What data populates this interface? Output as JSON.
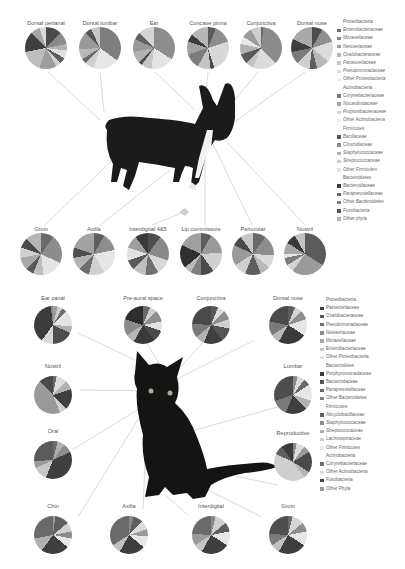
{
  "figure": {
    "dog_panel": {
      "top_sites": [
        "Dorsal perianal",
        "Dorsal lumbar",
        "Ear",
        "Concave pinna",
        "Conjunctiva",
        "Dorsal nose"
      ],
      "bottom_sites": [
        "Groin",
        "Axilla",
        "Interdigital 4&5",
        "Lip commissure",
        "Periocular",
        "Nostril"
      ],
      "legend": [
        {
          "type": "header",
          "label": "Proteobacteria"
        },
        {
          "type": "item",
          "label": "Enterobacteriaceae",
          "color": "#6d6d6d"
        },
        {
          "type": "item",
          "label": "Moraxellaceae",
          "color": "#8a8a8a"
        },
        {
          "type": "item",
          "label": "Neisseriaceae",
          "color": "#9f9f9f"
        },
        {
          "type": "item",
          "label": "Oxalobacteraceae",
          "color": "#b5b5b5"
        },
        {
          "type": "item",
          "label": "Pasteurellaceae",
          "color": "#cacaca"
        },
        {
          "type": "item",
          "label": "Pseudomonadaceae",
          "color": "#dcdcdc"
        },
        {
          "type": "item",
          "label": "Other Proteobacteria",
          "color": "#ececec"
        },
        {
          "type": "header",
          "label": "Actinobacteria"
        },
        {
          "type": "item",
          "label": "Corynebacteriaceae",
          "color": "#7a7a7a"
        },
        {
          "type": "item",
          "label": "Nocardioidaceae",
          "color": "#a5a5a5"
        },
        {
          "type": "item",
          "label": "Propionibacteriaceae",
          "color": "#d5d5d5"
        },
        {
          "type": "item",
          "label": "Other Actinobacteria",
          "color": "#efefef"
        },
        {
          "type": "header",
          "label": "Firmicutes"
        },
        {
          "type": "item",
          "label": "Bacillaceae",
          "color": "#5a5a5a"
        },
        {
          "type": "item",
          "label": "Clostridiaceae",
          "color": "#8c8c8c"
        },
        {
          "type": "item",
          "label": "Staphylococcaceae",
          "color": "#afafaf"
        },
        {
          "type": "item",
          "label": "Streptococcaceae",
          "color": "#c9c9c9"
        },
        {
          "type": "item",
          "label": "Other Firmicutes",
          "color": "#e6e6e6"
        },
        {
          "type": "header",
          "label": "Bacteroidetes"
        },
        {
          "type": "item",
          "label": "Bacteroidaceae",
          "color": "#3c3c3c"
        },
        {
          "type": "item",
          "label": "Paraprevotellaceae",
          "color": "#666666"
        },
        {
          "type": "item",
          "label": "Other Bacteroidetes",
          "color": "#7f7f7f"
        },
        {
          "type": "item",
          "label": "Fusobacteria",
          "color": "#555555"
        },
        {
          "type": "item",
          "label": "Other phyla",
          "color": "#b0b0b0"
        }
      ]
    },
    "cat_panel": {
      "top_sites": [
        "Ear canal",
        "Pre-aural space",
        "Conjunctiva",
        "Dorsal nose"
      ],
      "left_sites": [
        "Nostril",
        "Oral"
      ],
      "right_sites": [
        "Lumbar",
        "Reproductive"
      ],
      "bottom_sites": [
        "Chin",
        "Axilla",
        "Interdigital",
        "Groin"
      ],
      "legend": [
        {
          "type": "header",
          "label": "Proteobacteria"
        },
        {
          "type": "item",
          "label": "Pasteurellaceae",
          "color": "#404040"
        },
        {
          "type": "item",
          "label": "Oxalobacteraceae",
          "color": "#5a5a5a"
        },
        {
          "type": "item",
          "label": "Pseudomonadaceae",
          "color": "#6e6e6e"
        },
        {
          "type": "item",
          "label": "Neisseriaceae",
          "color": "#8a8a8a"
        },
        {
          "type": "item",
          "label": "Moraxellaceae",
          "color": "#a8a8a8"
        },
        {
          "type": "item",
          "label": "Enterobacteriaceae",
          "color": "#c8c8c8"
        },
        {
          "type": "item",
          "label": "Other Proteobacteria",
          "color": "#e4e4e4"
        },
        {
          "type": "header",
          "label": "Bacteroidetes"
        },
        {
          "type": "item",
          "label": "Porphyromonadaceae",
          "color": "#3a3a3a"
        },
        {
          "type": "item",
          "label": "Bacteroidaceae",
          "color": "#525252"
        },
        {
          "type": "item",
          "label": "Paraprevotellaceae",
          "color": "#686868"
        },
        {
          "type": "item",
          "label": "Other Bacteroidetes",
          "color": "#7e7e7e"
        },
        {
          "type": "header",
          "label": "Firmicutes"
        },
        {
          "type": "item",
          "label": "Alicyclobacillaceae",
          "color": "#606060"
        },
        {
          "type": "item",
          "label": "Staphylococcaceae",
          "color": "#8e8e8e"
        },
        {
          "type": "item",
          "label": "Streptococcaceae",
          "color": "#b0b0b0"
        },
        {
          "type": "item",
          "label": "Lachnospiraceae",
          "color": "#cdcdcd"
        },
        {
          "type": "item",
          "label": "Other Firmicutes",
          "color": "#e8e8e8"
        },
        {
          "type": "header",
          "label": "Actinobacteria"
        },
        {
          "type": "item",
          "label": "Corynebacteriaceae",
          "color": "#707070"
        },
        {
          "type": "item",
          "label": "Other Actinobacteria",
          "color": "#dedede"
        },
        {
          "type": "item",
          "label": "Fusobacteria",
          "color": "#484848"
        },
        {
          "type": "item",
          "label": "Other Phyla",
          "color": "#9a9a9a"
        }
      ]
    }
  }
}
